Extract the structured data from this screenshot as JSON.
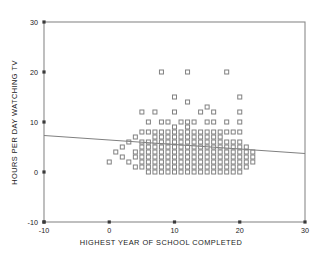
{
  "chart_data": {
    "type": "scatter",
    "title": "",
    "xlabel": "HIGHEST YEAR OF SCHOOL COMPLETED",
    "ylabel": "HOURS PER DAY WATCHING TV",
    "xlim": [
      -10,
      30
    ],
    "ylim": [
      -10,
      30
    ],
    "xticks": [
      -10,
      0,
      10,
      20,
      30
    ],
    "yticks": [
      -10,
      0,
      10,
      20,
      30
    ],
    "xtick_labels": [
      "-10",
      "0",
      "10",
      "20",
      "30"
    ],
    "ytick_labels": [
      "-10",
      "0",
      "10",
      "20",
      "30"
    ],
    "grid": false,
    "legend": false,
    "marker": "open-square",
    "marker_size": 4,
    "marker_color": "#808080",
    "frame": true,
    "points": [
      [
        0,
        2
      ],
      [
        1,
        4
      ],
      [
        2,
        3
      ],
      [
        2,
        5
      ],
      [
        3,
        2
      ],
      [
        3,
        6
      ],
      [
        4,
        1
      ],
      [
        4,
        3
      ],
      [
        4,
        4
      ],
      [
        4,
        7
      ],
      [
        5,
        1
      ],
      [
        5,
        2
      ],
      [
        5,
        3
      ],
      [
        5,
        4
      ],
      [
        5,
        5
      ],
      [
        5,
        6
      ],
      [
        5,
        8
      ],
      [
        5,
        12
      ],
      [
        6,
        0
      ],
      [
        6,
        1
      ],
      [
        6,
        2
      ],
      [
        6,
        3
      ],
      [
        6,
        4
      ],
      [
        6,
        5
      ],
      [
        6,
        6
      ],
      [
        6,
        8
      ],
      [
        6,
        10
      ],
      [
        7,
        0
      ],
      [
        7,
        1
      ],
      [
        7,
        2
      ],
      [
        7,
        3
      ],
      [
        7,
        4
      ],
      [
        7,
        5
      ],
      [
        7,
        6
      ],
      [
        7,
        7
      ],
      [
        7,
        8
      ],
      [
        7,
        12
      ],
      [
        8,
        0
      ],
      [
        8,
        1
      ],
      [
        8,
        2
      ],
      [
        8,
        3
      ],
      [
        8,
        4
      ],
      [
        8,
        5
      ],
      [
        8,
        6
      ],
      [
        8,
        7
      ],
      [
        8,
        8
      ],
      [
        8,
        10
      ],
      [
        8,
        20
      ],
      [
        9,
        0
      ],
      [
        9,
        1
      ],
      [
        9,
        2
      ],
      [
        9,
        3
      ],
      [
        9,
        4
      ],
      [
        9,
        5
      ],
      [
        9,
        6
      ],
      [
        9,
        7
      ],
      [
        9,
        8
      ],
      [
        9,
        10
      ],
      [
        10,
        0
      ],
      [
        10,
        1
      ],
      [
        10,
        2
      ],
      [
        10,
        3
      ],
      [
        10,
        4
      ],
      [
        10,
        5
      ],
      [
        10,
        6
      ],
      [
        10,
        7
      ],
      [
        10,
        8
      ],
      [
        10,
        9
      ],
      [
        10,
        12
      ],
      [
        10,
        15
      ],
      [
        11,
        0
      ],
      [
        11,
        1
      ],
      [
        11,
        2
      ],
      [
        11,
        3
      ],
      [
        11,
        4
      ],
      [
        11,
        5
      ],
      [
        11,
        6
      ],
      [
        11,
        7
      ],
      [
        11,
        8
      ],
      [
        11,
        10
      ],
      [
        12,
        0
      ],
      [
        12,
        1
      ],
      [
        12,
        2
      ],
      [
        12,
        3
      ],
      [
        12,
        4
      ],
      [
        12,
        5
      ],
      [
        12,
        6
      ],
      [
        12,
        7
      ],
      [
        12,
        8
      ],
      [
        12,
        9
      ],
      [
        12,
        10
      ],
      [
        12,
        14
      ],
      [
        12,
        20
      ],
      [
        13,
        0
      ],
      [
        13,
        1
      ],
      [
        13,
        2
      ],
      [
        13,
        3
      ],
      [
        13,
        4
      ],
      [
        13,
        5
      ],
      [
        13,
        6
      ],
      [
        13,
        7
      ],
      [
        13,
        8
      ],
      [
        13,
        10
      ],
      [
        14,
        0
      ],
      [
        14,
        1
      ],
      [
        14,
        2
      ],
      [
        14,
        3
      ],
      [
        14,
        4
      ],
      [
        14,
        5
      ],
      [
        14,
        6
      ],
      [
        14,
        7
      ],
      [
        14,
        8
      ],
      [
        14,
        12
      ],
      [
        15,
        0
      ],
      [
        15,
        1
      ],
      [
        15,
        2
      ],
      [
        15,
        3
      ],
      [
        15,
        4
      ],
      [
        15,
        5
      ],
      [
        15,
        6
      ],
      [
        15,
        7
      ],
      [
        15,
        8
      ],
      [
        15,
        10
      ],
      [
        15,
        13
      ],
      [
        16,
        0
      ],
      [
        16,
        1
      ],
      [
        16,
        2
      ],
      [
        16,
        3
      ],
      [
        16,
        4
      ],
      [
        16,
        5
      ],
      [
        16,
        6
      ],
      [
        16,
        7
      ],
      [
        16,
        8
      ],
      [
        16,
        10
      ],
      [
        16,
        12
      ],
      [
        17,
        0
      ],
      [
        17,
        1
      ],
      [
        17,
        2
      ],
      [
        17,
        3
      ],
      [
        17,
        4
      ],
      [
        17,
        5
      ],
      [
        17,
        6
      ],
      [
        17,
        7
      ],
      [
        17,
        8
      ],
      [
        18,
        0
      ],
      [
        18,
        1
      ],
      [
        18,
        2
      ],
      [
        18,
        3
      ],
      [
        18,
        4
      ],
      [
        18,
        5
      ],
      [
        18,
        6
      ],
      [
        18,
        8
      ],
      [
        18,
        10
      ],
      [
        18,
        20
      ],
      [
        19,
        0
      ],
      [
        19,
        1
      ],
      [
        19,
        2
      ],
      [
        19,
        3
      ],
      [
        19,
        4
      ],
      [
        19,
        5
      ],
      [
        19,
        6
      ],
      [
        19,
        8
      ],
      [
        20,
        0
      ],
      [
        20,
        1
      ],
      [
        20,
        2
      ],
      [
        20,
        3
      ],
      [
        20,
        4
      ],
      [
        20,
        5
      ],
      [
        20,
        6
      ],
      [
        20,
        8
      ],
      [
        20,
        10
      ],
      [
        20,
        12
      ],
      [
        20,
        15
      ],
      [
        21,
        1
      ],
      [
        21,
        2
      ],
      [
        21,
        3
      ],
      [
        21,
        4
      ],
      [
        21,
        5
      ],
      [
        22,
        2
      ],
      [
        22,
        3
      ],
      [
        22,
        4
      ]
    ],
    "regression_line": {
      "x_start": -10,
      "y_start": 7.3,
      "x_end": 30,
      "y_end": 3.7,
      "color": "#808080"
    }
  }
}
